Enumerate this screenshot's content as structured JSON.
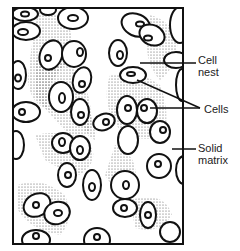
{
  "diagram": {
    "title": "",
    "labels": {
      "cell_nest": [
        "Cell",
        "nest"
      ],
      "cells": "Cells",
      "solid_matrix": [
        "Solid",
        "matrix"
      ]
    },
    "colors": {
      "outline": "#111111",
      "stipple": "#333333",
      "background": "#ffffff"
    }
  }
}
